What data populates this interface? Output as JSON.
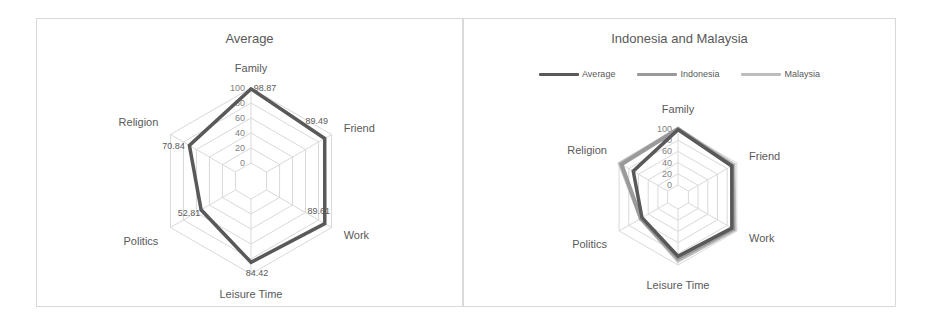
{
  "chart_data": [
    {
      "type": "radar",
      "title": "Average",
      "categories": [
        "Family",
        "Friend",
        "Work",
        "Leisure Time",
        "Politics",
        "Religion"
      ],
      "series": [
        {
          "name": "Average",
          "values": [
            98.87,
            89.49,
            89.61,
            84.42,
            52.81,
            70.84
          ],
          "source": "data labels printed on chart"
        }
      ],
      "rlim": [
        0,
        100
      ],
      "ticks": [
        0,
        20,
        40,
        60,
        80,
        100
      ],
      "legend": "none",
      "data_labels": true
    },
    {
      "type": "radar",
      "title": "Indonesia and Malaysia",
      "categories": [
        "Family",
        "Friend",
        "Work",
        "Leisure Time",
        "Politics",
        "Religion"
      ],
      "series": [
        {
          "name": "Average",
          "values": [
            98.87,
            89.49,
            89.61,
            84.42,
            52.81,
            70.84
          ],
          "source": "same as left chart labels"
        },
        {
          "name": "Indonesia",
          "values": [
            100,
            90,
            92,
            88,
            55,
            95
          ],
          "source": "visual estimate, no data labels, ~±5"
        },
        {
          "name": "Malaysia",
          "values": [
            100,
            93,
            95,
            92,
            55,
            98
          ],
          "source": "visual estimate, no data labels, ~±5"
        }
      ],
      "rlim": [
        0,
        100
      ],
      "ticks": [
        0,
        20,
        40,
        60,
        80,
        100
      ],
      "legend": "top",
      "data_labels": false
    }
  ],
  "colors": {
    "average": "#595959",
    "indonesia": "#9a9a9a",
    "malaysia": "#bdbdbd",
    "grid": "#d9d9d9",
    "border": "#d9d9d9"
  },
  "left": {
    "title": "Average"
  },
  "right": {
    "title": "Indonesia and Malaysia",
    "legend": [
      {
        "label": "Average",
        "color": "#595959"
      },
      {
        "label": "Indonesia",
        "color": "#9a9a9a"
      },
      {
        "label": "Malaysia",
        "color": "#bdbdbd"
      }
    ]
  }
}
